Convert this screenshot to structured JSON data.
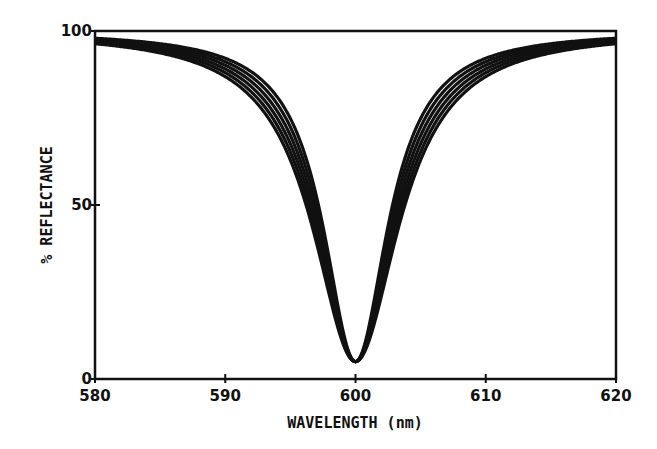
{
  "chart_data": {
    "type": "line",
    "title": "",
    "xlabel": "WAVELENGTH (nm)",
    "ylabel": "% REFLECTANCE",
    "xlim": [
      580,
      620
    ],
    "ylim": [
      0,
      100
    ],
    "x_ticks": [
      580,
      590,
      600,
      610,
      620
    ],
    "y_ticks": [
      0,
      50,
      100
    ],
    "grid": false,
    "legend": null,
    "series": [
      {
        "name": "curve-1",
        "center": 600.0,
        "min": 5,
        "half_width": 3.0
      },
      {
        "name": "curve-2",
        "center": 600.0,
        "min": 5,
        "half_width": 3.2
      },
      {
        "name": "curve-3",
        "center": 600.0,
        "min": 5,
        "half_width": 3.4
      },
      {
        "name": "curve-4",
        "center": 600.0,
        "min": 5,
        "half_width": 3.6
      },
      {
        "name": "curve-5",
        "center": 600.0,
        "min": 5,
        "half_width": 3.8
      },
      {
        "name": "curve-6",
        "center": 600.0,
        "min": 5,
        "half_width": 4.0
      }
    ],
    "x": [
      580,
      585,
      590,
      594,
      596,
      598,
      599,
      600,
      601,
      602,
      604,
      606,
      610,
      615,
      620
    ],
    "values": [
      97,
      96,
      91,
      76,
      58,
      29,
      13,
      5,
      13,
      29,
      58,
      76,
      91,
      96,
      97
    ]
  }
}
